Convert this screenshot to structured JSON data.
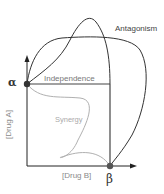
{
  "diagram": {
    "type": "isobologram",
    "labels": {
      "antagonism": "Antagonism",
      "independence": "Independence",
      "synergy": "Synergy",
      "y_axis": "[Drug A]",
      "x_axis": "[Drug B]",
      "alpha": "α",
      "beta": "β"
    },
    "colors": {
      "antagonism_curve": "#333333",
      "independence_line": "#444444",
      "synergy_curve": "#b0b0b0",
      "axes": "#222222",
      "points": "#333333"
    }
  }
}
